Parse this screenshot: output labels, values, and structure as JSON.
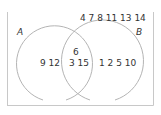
{
  "diagram": {
    "type": "venn",
    "sets": [
      {
        "name": "A",
        "label": "A"
      },
      {
        "name": "B",
        "label": "B"
      }
    ],
    "regions": {
      "only_A": "9 12",
      "intersection_top": "6",
      "intersection_bottom": "3 15",
      "only_B": "1 2 5 10",
      "outside": "4 7 8 11 13 14"
    },
    "colors": {
      "frame": "#c8c8c8",
      "circle": "#b4b4b4",
      "text": "#333333"
    }
  }
}
